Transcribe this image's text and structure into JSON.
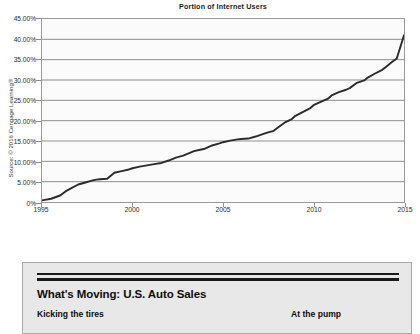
{
  "chart_data": {
    "type": "line",
    "title": "Portion of Internet Users",
    "xlabel": "",
    "ylabel": "",
    "xlim": [
      1995,
      2015
    ],
    "ylim": [
      0,
      45
    ],
    "grid": true,
    "legend": false,
    "y_tick_labels": [
      "45.00%",
      "40.00%",
      "35.00%",
      "30.00%",
      "25.00%",
      "20.00%",
      "15.00%",
      "10.00%",
      "5.00%",
      "0%"
    ],
    "y_tick_values": [
      45,
      40,
      35,
      30,
      25,
      20,
      15,
      10,
      5,
      0
    ],
    "x_tick_labels": [
      "1995",
      "2000",
      "2005",
      "2010",
      "2015"
    ],
    "x_tick_values": [
      1995,
      2000,
      2005,
      2010,
      2015
    ],
    "series": [
      {
        "name": "Portion of Internet Users",
        "color": "#2b2b2b",
        "x": [
          1995.0,
          1995.5,
          1996.0,
          1996.3,
          1996.7,
          1997.0,
          1997.4,
          1997.8,
          1998.0,
          1998.2,
          1998.6,
          1999.0,
          1999.4,
          1999.8,
          2000.0,
          2000.4,
          2000.8,
          2001.2,
          2001.6,
          2002.0,
          2002.4,
          2002.8,
          2003.0,
          2003.4,
          2003.8,
          2004.0,
          2004.4,
          2004.8,
          2005.0,
          2005.4,
          2005.8,
          2006.0,
          2006.4,
          2006.8,
          2007.0,
          2007.4,
          2007.8,
          2008.0,
          2008.4,
          2008.8,
          2009.0,
          2009.4,
          2009.8,
          2010.0,
          2010.4,
          2010.8,
          2011.0,
          2011.4,
          2011.8,
          2012.0,
          2012.4,
          2012.8,
          2013.0,
          2013.4,
          2013.8,
          2014.0,
          2014.3,
          2014.6,
          2015.0
        ],
        "y": [
          0.4,
          0.8,
          1.6,
          2.6,
          3.6,
          4.3,
          4.8,
          5.3,
          5.5,
          5.6,
          5.7,
          7.2,
          7.6,
          8.0,
          8.3,
          8.7,
          9.0,
          9.3,
          9.6,
          10.2,
          10.9,
          11.4,
          11.8,
          12.5,
          12.9,
          13.1,
          13.9,
          14.4,
          14.7,
          15.1,
          15.4,
          15.5,
          15.6,
          16.1,
          16.4,
          17.0,
          17.5,
          18.2,
          19.5,
          20.4,
          21.2,
          22.1,
          23.0,
          23.8,
          24.6,
          25.4,
          26.2,
          27.0,
          27.6,
          28.0,
          29.3,
          29.9,
          30.6,
          31.6,
          32.5,
          33.2,
          34.3,
          35.3,
          41.0
        ]
      }
    ],
    "annotations": [],
    "source": "Source: © 2016 Cengage Learning®"
  },
  "auto_sales_panel": {
    "title": "What's Moving: U.S. Auto Sales",
    "subhead_left": "Kicking the tires",
    "subhead_right": "At the pump"
  }
}
